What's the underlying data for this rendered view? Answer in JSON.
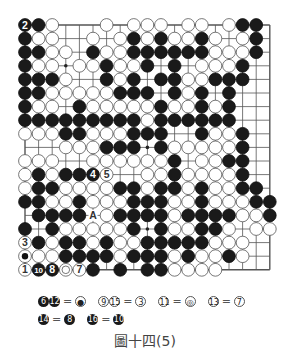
{
  "board": {
    "size": 19,
    "origin_x": 25,
    "origin_y": 25,
    "spacing": 13.6,
    "rows": [
      "BBW...W.WWW.WW.WBB.",
      "BWW..W.WBWBWWBW.WB.",
      "BBWW.BWWBBBBBBWWWB.",
      "BWW.WWBWWB.B.WWWB..",
      "BBBW..BWB.BBWWBBB..",
      "BBWWWWWBBB.BWB.B...",
      "BWW.BWWWWWBWWBWB...",
      "BBBBBBBBBWBBBBBB...",
      "WWWBBWWWBBB..BWWB..",
      "...WWWBBB.BWWWWWB..",
      "WWW..WWWWWWB.WWBB..",
      "WBWBBBW..WWBWWWWB..",
      "WBBWWWWBBWBBWBWWBB.",
      "BBWWBWWWBBBWWBWWWBB",
      ".BBBB.WBBBBWBBBBWWB",
      "B.BWWWWWB.BWWBBW.WW",
      "WBWBBWBWWBBBBBWWW..",
      "WWWBBBBWBBBWBWWBW..",
      "WBBWWB.B.BBWWWW...."
    ],
    "labels": [
      {
        "row": 0,
        "col": 0,
        "text": "2",
        "color": "B"
      },
      {
        "row": 11,
        "col": 5,
        "text": "4",
        "color": "B"
      },
      {
        "row": 11,
        "col": 6,
        "text": "5",
        "color": "W"
      },
      {
        "row": 16,
        "col": 0,
        "text": "3",
        "color": "W"
      },
      {
        "row": 17,
        "col": 0,
        "text": "●",
        "color": "W",
        "mark": "dot"
      },
      {
        "row": 18,
        "col": 0,
        "text": "1",
        "color": "W"
      },
      {
        "row": 18,
        "col": 1,
        "text": "10",
        "color": "B"
      },
      {
        "row": 18,
        "col": 2,
        "text": "8",
        "color": "B"
      },
      {
        "row": 18,
        "col": 3,
        "text": "",
        "color": "W",
        "mark": "ring"
      },
      {
        "row": 18,
        "col": 4,
        "text": "7",
        "color": "W"
      },
      {
        "row": 14,
        "col": 5,
        "text": "A",
        "color": "E"
      }
    ],
    "star_points": [
      [
        3,
        3
      ],
      [
        3,
        9
      ],
      [
        3,
        15
      ],
      [
        9,
        3
      ],
      [
        9,
        9
      ],
      [
        9,
        15
      ],
      [
        15,
        3
      ],
      [
        15,
        9
      ],
      [
        15,
        15
      ]
    ]
  },
  "legend": {
    "row1": [
      {
        "lhs": [
          {
            "n": "6",
            "c": "b"
          },
          {
            "n": "12",
            "c": "b"
          }
        ],
        "eq": "=",
        "rhs": {
          "n": "●",
          "c": "w"
        }
      },
      {
        "lhs": [
          {
            "n": "9",
            "c": "w"
          },
          {
            "n": "15",
            "c": "w"
          }
        ],
        "eq": "=",
        "rhs": {
          "n": "3",
          "c": "w"
        }
      },
      {
        "lhs": [
          {
            "n": "11",
            "c": "w"
          }
        ],
        "eq": "=",
        "rhs": {
          "n": "◎",
          "c": "w"
        }
      },
      {
        "lhs": [
          {
            "n": "13",
            "c": "w"
          }
        ],
        "eq": "=",
        "rhs": {
          "n": "7",
          "c": "w"
        }
      }
    ],
    "row2": [
      {
        "lhs": [
          {
            "n": "14",
            "c": "b"
          }
        ],
        "eq": "=",
        "rhs": {
          "n": "8",
          "c": "b"
        }
      },
      {
        "lhs": [
          {
            "n": "16",
            "c": "b"
          }
        ],
        "eq": "=",
        "rhs": {
          "n": "10",
          "c": "b"
        }
      }
    ]
  },
  "caption": "圖十四(5)",
  "colors": {
    "line": "#555555",
    "black_stone": "#1a1a1a",
    "white_stone": "#ffffff",
    "stone_edge": "#555555"
  }
}
